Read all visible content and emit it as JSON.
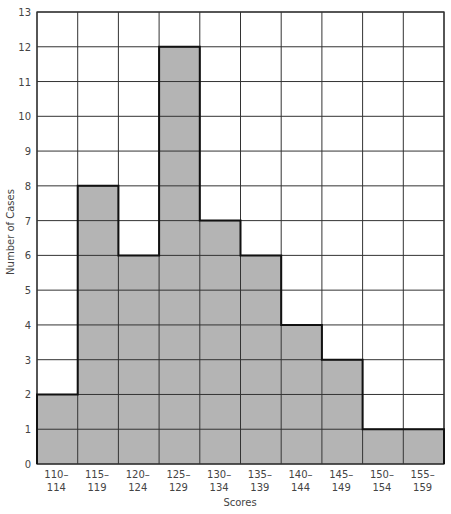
{
  "chart_data": {
    "type": "bar",
    "subtype": "histogram",
    "title": "",
    "xlabel": "Scores",
    "ylabel": "Number of Cases",
    "categories": [
      "110–114",
      "115–119",
      "120–124",
      "125–129",
      "130–134",
      "135–139",
      "140–144",
      "145–149",
      "150–154",
      "155–159"
    ],
    "category_lines": [
      [
        "110–",
        "114"
      ],
      [
        "115–",
        "119"
      ],
      [
        "120–",
        "124"
      ],
      [
        "125–",
        "129"
      ],
      [
        "130–",
        "134"
      ],
      [
        "135–",
        "139"
      ],
      [
        "140–",
        "144"
      ],
      [
        "145–",
        "149"
      ],
      [
        "150–",
        "154"
      ],
      [
        "155–",
        "159"
      ]
    ],
    "values": [
      2,
      8,
      6,
      12,
      7,
      6,
      4,
      3,
      1,
      1
    ],
    "ylim": [
      0,
      13
    ],
    "yticks": [
      0,
      1,
      2,
      3,
      4,
      5,
      6,
      7,
      8,
      9,
      10,
      11,
      12,
      13
    ],
    "grid": true,
    "legend": null,
    "colors": {
      "bar_fill": "#b4b4b4",
      "grid": "#333333",
      "outline": "#111111",
      "background": "#ffffff"
    }
  }
}
